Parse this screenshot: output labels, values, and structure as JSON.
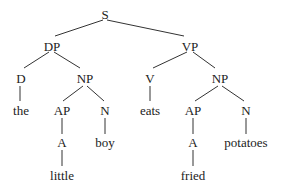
{
  "diagram": {
    "type": "syntax-tree",
    "nodes": {
      "s": "S",
      "dp": "DP",
      "vp": "VP",
      "d": "D",
      "np1": "NP",
      "v": "V",
      "np2": "NP",
      "the": "the",
      "ap1": "AP",
      "n1": "N",
      "eats": "eats",
      "ap2": "AP",
      "n2": "N",
      "a1": "A",
      "boy": "boy",
      "a2": "A",
      "potatoes": "potatoes",
      "little": "little",
      "fried": "fried"
    },
    "edges": [
      [
        "S",
        "DP"
      ],
      [
        "S",
        "VP"
      ],
      [
        "DP",
        "D"
      ],
      [
        "DP",
        "NP"
      ],
      [
        "VP",
        "V"
      ],
      [
        "VP",
        "NP"
      ],
      [
        "D",
        "the"
      ],
      [
        "NP",
        "AP"
      ],
      [
        "NP",
        "N"
      ],
      [
        "V",
        "eats"
      ],
      [
        "NP",
        "AP"
      ],
      [
        "NP",
        "N"
      ],
      [
        "AP",
        "A"
      ],
      [
        "N",
        "boy"
      ],
      [
        "AP",
        "A"
      ],
      [
        "N",
        "potatoes"
      ],
      [
        "A",
        "little"
      ],
      [
        "A",
        "fried"
      ]
    ],
    "line_color": "#333333"
  }
}
